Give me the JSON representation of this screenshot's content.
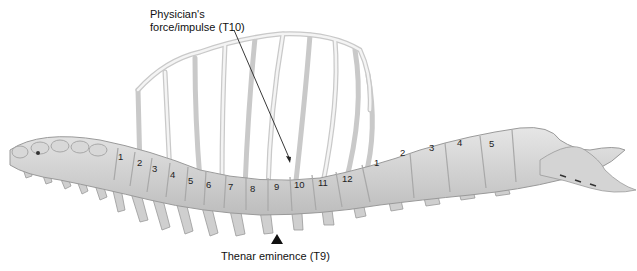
{
  "figure": {
    "annotations": {
      "top_label_line1": "Physician's",
      "top_label_line2": "force/impulse (T10)",
      "bottom_label": "Thenar eminence (T9)"
    },
    "thoracic_vertebrae_labels": [
      "1",
      "2",
      "3",
      "4",
      "5",
      "6",
      "7",
      "8",
      "9",
      "10",
      "11",
      "12"
    ],
    "lumbar_vertebrae_labels": [
      "1",
      "2",
      "3",
      "4",
      "5"
    ],
    "colors": {
      "bone_fill": "#dcdcdc",
      "bone_stroke": "#9a9a9a",
      "rib_fill": "#eeeeee",
      "arrow": "#222222",
      "background": "#ffffff"
    }
  }
}
